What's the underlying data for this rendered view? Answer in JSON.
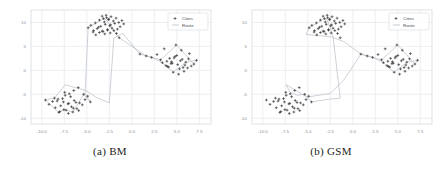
{
  "figure": {
    "subfigures": [
      {
        "id": "bm",
        "caption_index": "(a)",
        "caption_label": "BM",
        "legend": {
          "cities": "Cities",
          "route": "Route"
        }
      },
      {
        "id": "gsm",
        "caption_index": "(b)",
        "caption_label": "GSM",
        "legend": {
          "cities": "Cities",
          "route": "Route"
        }
      }
    ]
  },
  "colors": {
    "point": "#3b3b3b",
    "route": "#b9bfc6",
    "grid": "#e8ebef",
    "axis_text": "#8a8f96",
    "frame": "#d5d9de",
    "background": "#ffffff",
    "caption": "#1b1b1b"
  },
  "chart_data": [
    {
      "type": "scatter",
      "title": "(a) BM",
      "xlabel": "",
      "ylabel": "",
      "xlim": [
        -11.2,
        8.8
      ],
      "ylim": [
        -11.2,
        12.6
      ],
      "grid": true,
      "legend_position": "upper right",
      "xticks": [
        -10.0,
        -7.5,
        -5.0,
        -2.5,
        0.0,
        2.5,
        5.0,
        7.5
      ],
      "xticklabels": [
        "-10.0",
        "-7.5",
        "-5.0",
        "-2.5",
        "0.0",
        "2.5",
        "5.0",
        "7.5"
      ],
      "yticks": [
        -10,
        -5,
        0,
        5,
        10
      ],
      "yticklabels": [
        "-10",
        "-5",
        "0",
        "5",
        "10"
      ],
      "series": [
        {
          "name": "Cities",
          "marker": "+",
          "x": [
            -4.85,
            -4.55,
            -4.25,
            -4.05,
            -3.85,
            -3.6,
            -3.45,
            -3.3,
            -3.2,
            -3.05,
            -2.95,
            -2.8,
            -2.7,
            -2.55,
            -2.45,
            -2.3,
            -2.2,
            -2.05,
            -1.9,
            -1.75,
            -1.6,
            -1.45,
            -1.3,
            -1.1,
            -0.9,
            -3.6,
            -3.3,
            -3.0,
            -2.7,
            -2.4,
            -4.3,
            -4.0,
            -3.7,
            -2.0,
            -1.7,
            -1.4,
            -3.15,
            -2.85,
            -2.6,
            -2.35,
            0.9,
            1.6,
            2.2,
            2.8,
            3.2,
            3.6,
            3.9,
            4.2,
            4.5,
            4.8,
            5.1,
            5.4,
            5.7,
            6.0,
            6.3,
            6.6,
            6.9,
            7.2,
            3.4,
            3.8,
            4.1,
            4.4,
            4.7,
            5.0,
            5.3,
            5.6,
            5.9,
            6.2,
            4.6,
            5.2,
            5.8,
            4.9,
            5.5,
            6.4,
            4.35,
            3.95,
            -9.6,
            -9.2,
            -8.8,
            -8.5,
            -8.2,
            -7.9,
            -7.6,
            -7.3,
            -7.0,
            -6.7,
            -6.4,
            -6.1,
            -5.8,
            -5.5,
            -5.2,
            -4.9,
            -8.6,
            -8.3,
            -8.0,
            -7.7,
            -7.4,
            -7.1,
            -6.8,
            -6.5,
            -6.2,
            -5.9,
            -7.45,
            -6.95,
            -6.45,
            -5.95,
            -8.1,
            -7.55,
            -7.05,
            -6.55,
            -5.35,
            -4.6
          ],
          "y": [
            8.9,
            9.4,
            8.3,
            9.9,
            8.7,
            10.5,
            9.2,
            11.3,
            8.1,
            10.1,
            9.6,
            11.0,
            8.5,
            10.7,
            9.3,
            11.2,
            8.8,
            10.3,
            9.8,
            10.9,
            8.6,
            10.0,
            9.1,
            10.4,
            9.7,
            7.9,
            8.2,
            7.6,
            8.4,
            7.8,
            8.0,
            7.4,
            9.0,
            8.3,
            7.7,
            6.8,
            10.8,
            11.5,
            10.6,
            9.5,
            3.4,
            3.0,
            2.7,
            3.3,
            2.2,
            4.5,
            1.9,
            2.5,
            1.5,
            2.9,
            1.2,
            2.0,
            0.6,
            1.7,
            2.4,
            0.9,
            1.3,
            2.1,
            1.6,
            1.0,
            0.7,
            1.8,
            2.6,
            3.1,
            0.3,
            2.3,
            1.1,
            0.5,
            -0.4,
            -0.8,
            -0.2,
            5.3,
            4.2,
            3.5,
            1.4,
            0.8,
            -6.2,
            -7.1,
            -6.5,
            -7.8,
            -6.0,
            -7.4,
            -6.6,
            -8.3,
            -6.9,
            -7.6,
            -6.3,
            -8.0,
            -6.8,
            -7.2,
            -6.1,
            -5.4,
            -5.8,
            -6.4,
            -8.6,
            -5.9,
            -5.2,
            -7.0,
            -5.5,
            -7.9,
            -6.7,
            -8.4,
            -4.6,
            -4.9,
            -4.2,
            -3.6,
            -8.8,
            -8.2,
            -9.0,
            -8.7,
            -5.0,
            -6.6
          ]
        },
        {
          "name": "Route",
          "marker": "line",
          "x": [
            -7.4,
            -5.1,
            -4.0,
            -2.5,
            -2.0,
            -1.0,
            0.9,
            3.2,
            5.0,
            6.9,
            7.2,
            6.0,
            4.6,
            3.4,
            2.2,
            1.6,
            -1.4,
            -2.85,
            -3.15,
            -4.85,
            -5.2,
            -4.6,
            -5.35,
            -6.55,
            -7.55,
            -8.1,
            -9.6,
            -8.6,
            -7.4
          ],
          "y": [
            -3.0,
            -4.2,
            -5.6,
            -6.8,
            6.8,
            7.7,
            3.4,
            2.2,
            5.3,
            1.3,
            2.1,
            1.7,
            -0.4,
            1.6,
            2.7,
            3.0,
            6.8,
            10.6,
            10.8,
            8.9,
            -5.0,
            -6.6,
            -5.0,
            -8.7,
            -8.2,
            -8.8,
            -6.2,
            -5.8,
            -3.0
          ]
        }
      ]
    },
    {
      "type": "scatter",
      "title": "(b) GSM",
      "xlabel": "",
      "ylabel": "",
      "xlim": [
        -11.2,
        8.8
      ],
      "ylim": [
        -11.2,
        12.6
      ],
      "grid": true,
      "legend_position": "upper right",
      "xticks": [
        -10.0,
        -7.5,
        -5.0,
        -2.5,
        0.0,
        2.5,
        5.0,
        7.5
      ],
      "xticklabels": [
        "-10.0",
        "-7.5",
        "-5.0",
        "-2.5",
        "0.0",
        "2.5",
        "5.0",
        "7.5"
      ],
      "yticks": [
        -10,
        -5,
        0,
        5,
        10
      ],
      "yticklabels": [
        "-10",
        "-5",
        "0",
        "5",
        "10"
      ],
      "series": [
        {
          "name": "Cities",
          "marker": "+",
          "x": [
            -4.85,
            -4.55,
            -4.25,
            -4.05,
            -3.85,
            -3.6,
            -3.45,
            -3.3,
            -3.2,
            -3.05,
            -2.95,
            -2.8,
            -2.7,
            -2.55,
            -2.45,
            -2.3,
            -2.2,
            -2.05,
            -1.9,
            -1.75,
            -1.6,
            -1.45,
            -1.3,
            -1.1,
            -0.9,
            -3.6,
            -3.3,
            -3.0,
            -2.7,
            -2.4,
            -4.3,
            -4.0,
            -3.7,
            -2.0,
            -1.7,
            -1.4,
            -3.15,
            -2.85,
            -2.6,
            -2.35,
            0.9,
            1.6,
            2.2,
            2.8,
            3.2,
            3.6,
            3.9,
            4.2,
            4.5,
            4.8,
            5.1,
            5.4,
            5.7,
            6.0,
            6.3,
            6.6,
            6.9,
            7.2,
            3.4,
            3.8,
            4.1,
            4.4,
            4.7,
            5.0,
            5.3,
            5.6,
            5.9,
            6.2,
            4.6,
            5.2,
            5.8,
            4.9,
            5.5,
            6.4,
            4.35,
            3.95,
            -9.6,
            -9.2,
            -8.8,
            -8.5,
            -8.2,
            -7.9,
            -7.6,
            -7.3,
            -7.0,
            -6.7,
            -6.4,
            -6.1,
            -5.8,
            -5.5,
            -5.2,
            -4.9,
            -8.6,
            -8.3,
            -8.0,
            -7.7,
            -7.4,
            -7.1,
            -6.8,
            -6.5,
            -6.2,
            -5.9,
            -7.45,
            -6.95,
            -6.45,
            -5.95,
            -8.1,
            -7.55,
            -7.05,
            -6.55,
            -5.35,
            -4.6
          ],
          "y": [
            8.9,
            9.4,
            8.3,
            9.9,
            8.7,
            10.5,
            9.2,
            11.3,
            8.1,
            10.1,
            9.6,
            11.0,
            8.5,
            10.7,
            9.3,
            11.2,
            8.8,
            10.3,
            9.8,
            10.9,
            8.6,
            10.0,
            9.1,
            10.4,
            9.7,
            7.9,
            8.2,
            7.6,
            8.4,
            7.8,
            8.0,
            7.4,
            9.0,
            8.3,
            7.7,
            6.8,
            10.8,
            11.5,
            10.6,
            9.5,
            3.4,
            3.0,
            2.7,
            3.3,
            2.2,
            4.5,
            1.9,
            2.5,
            1.5,
            2.9,
            1.2,
            2.0,
            0.6,
            1.7,
            2.4,
            0.9,
            1.3,
            2.1,
            1.6,
            1.0,
            0.7,
            1.8,
            2.6,
            3.1,
            0.3,
            2.3,
            1.1,
            0.5,
            -0.4,
            -0.8,
            -0.2,
            5.3,
            4.2,
            3.5,
            1.4,
            0.8,
            -6.2,
            -7.1,
            -6.5,
            -7.8,
            -6.0,
            -7.4,
            -6.6,
            -8.3,
            -6.9,
            -7.6,
            -6.3,
            -8.0,
            -6.8,
            -7.2,
            -6.1,
            -5.4,
            -5.8,
            -6.4,
            -8.6,
            -5.9,
            -5.2,
            -7.0,
            -5.5,
            -7.9,
            -6.7,
            -8.4,
            -4.6,
            -4.9,
            -4.2,
            -3.6,
            -8.8,
            -8.2,
            -9.0,
            -8.7,
            -5.0,
            -6.6
          ]
        },
        {
          "name": "Route",
          "marker": "line",
          "x": [
            -7.4,
            -7.0,
            -6.2,
            -5.35,
            -4.6,
            -2.6,
            -1.4,
            -2.2,
            -2.85,
            -3.15,
            -4.85,
            -5.2,
            -2.4,
            -1.0,
            0.9,
            3.2,
            5.0,
            6.9,
            7.2,
            6.0,
            4.6,
            3.4,
            2.2,
            1.6,
            0.9,
            -1.0,
            -2.5,
            -5.1,
            -7.4
          ],
          "y": [
            -3.0,
            -4.5,
            -5.2,
            -5.0,
            -6.6,
            -6.0,
            -5.8,
            7.2,
            10.6,
            10.8,
            8.9,
            7.5,
            7.0,
            6.0,
            3.4,
            2.2,
            5.3,
            1.3,
            2.1,
            1.7,
            -0.4,
            1.6,
            2.7,
            3.0,
            3.4,
            -2.0,
            -4.8,
            -5.6,
            -3.0
          ]
        }
      ]
    }
  ]
}
